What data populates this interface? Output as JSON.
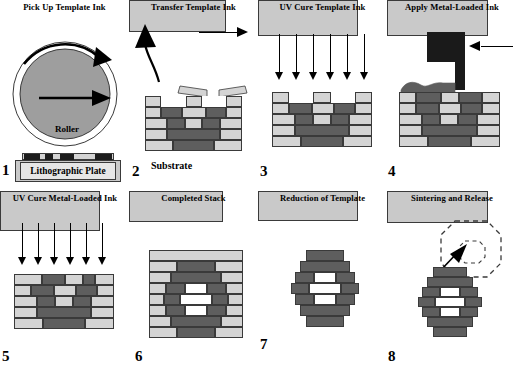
{
  "figure": {
    "colors": {
      "template_ink": "#d4d4d4",
      "metal_loaded_ink": "#5e5e5e",
      "substrate": "#c9c9c9",
      "roller_fill": "#9e9e9e",
      "outline": "#3a3a3a",
      "arrow": "#000000",
      "void": "#ffffff"
    }
  },
  "panels": [
    {
      "number": "1",
      "title": "Pick Up Template Ink",
      "labels": {
        "roller": "Roller",
        "plate": "Lithographic Plate"
      },
      "elements": [
        "roller-circle",
        "rotation-arrow",
        "translation-arrow",
        "ink-pattern",
        "lithographic-plate"
      ]
    },
    {
      "number": "2",
      "title": "Transfer Template Ink",
      "labels": {
        "substrate": "Substrate"
      },
      "elements": [
        "curved-lift-arrow",
        "advance-arrow",
        "brick-stack",
        "peeled-ink-flaps",
        "substrate"
      ]
    },
    {
      "number": "3",
      "title": "UV Cure Template Ink",
      "labels": {},
      "uv_arrow_count": 6,
      "elements": [
        "uv-arrows",
        "brick-stack",
        "substrate"
      ]
    },
    {
      "number": "4",
      "title": "Apply Metal-Loaded Ink",
      "labels": {},
      "elements": [
        "dispenser-nozzle",
        "feed-arrow",
        "ink-blob",
        "brick-stack",
        "substrate"
      ]
    },
    {
      "number": "5",
      "title": "UV Cure Metal-Loaded Ink",
      "labels": {},
      "uv_arrow_count": 6,
      "elements": [
        "uv-arrows",
        "filled-brick-stack",
        "substrate"
      ]
    },
    {
      "number": "6",
      "title": "Completed Stack",
      "labels": {},
      "elements": [
        "filled-brick-stack",
        "substrate"
      ]
    },
    {
      "number": "7",
      "title": "Reduction of Template",
      "labels": {},
      "elements": [
        "metal-ring",
        "substrate"
      ]
    },
    {
      "number": "8",
      "title": "Sintering and Release",
      "labels": {},
      "elements": [
        "metal-ring",
        "released-part-outline",
        "release-arrow",
        "substrate"
      ]
    }
  ]
}
